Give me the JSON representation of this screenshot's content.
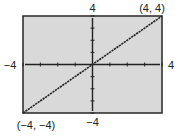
{
  "chart_data": {
    "type": "line",
    "title": "",
    "xlabel": "",
    "ylabel": "",
    "xlim": [
      -4,
      4
    ],
    "ylim": [
      -4,
      4
    ],
    "xticks_step": 1,
    "yticks_step": 1,
    "grid": false,
    "series": [
      {
        "name": "y = x",
        "x": [
          -4,
          4
        ],
        "y": [
          -4,
          4
        ]
      }
    ],
    "window_labels": {
      "xmin": "−4",
      "xmax": "4",
      "ymin": "−4",
      "ymax": "4"
    },
    "annotations": [
      {
        "text": "(4, 4)",
        "x": 4,
        "y": 4,
        "position": "top-right"
      },
      {
        "text": "(−4, −4)",
        "x": -4,
        "y": -4,
        "position": "bottom-left"
      }
    ],
    "colors": {
      "background": "#d9d9d9",
      "frame": "#333333",
      "axis": "#222222",
      "line": "#222222"
    }
  }
}
